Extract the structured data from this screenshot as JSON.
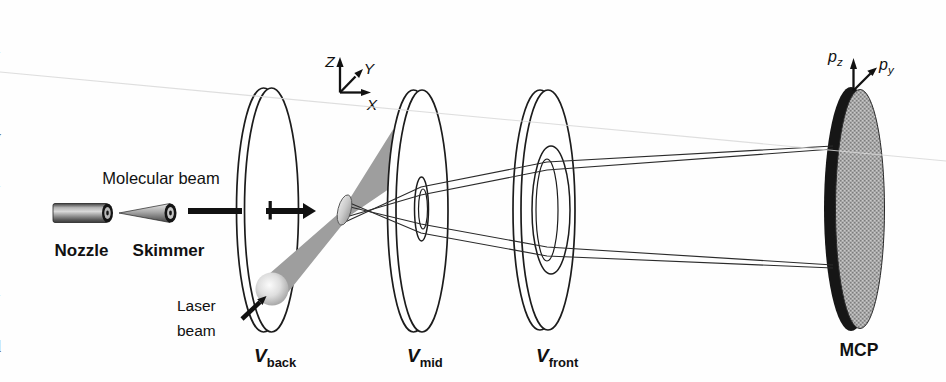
{
  "figure": {
    "labels": {
      "molecular_beam": "Molecular beam",
      "nozzle": "Nozzle",
      "skimmer": "Skimmer",
      "laser_line1": "Laser",
      "laser_line2": "beam",
      "v_back": {
        "main": "V",
        "sub": "back"
      },
      "v_mid": {
        "main": "V",
        "sub": "mid"
      },
      "v_front": {
        "main": "V",
        "sub": "front"
      },
      "mcp": "MCP",
      "axes": {
        "x": "X",
        "y": "Y",
        "z": "Z"
      },
      "momentum": {
        "pz_main": "p",
        "pz_sub": "z",
        "py_main": "p",
        "py_sub": "y"
      }
    },
    "colors": {
      "background": "#fefefe",
      "line": "#1c1c1c",
      "laser_beam_gray": "#9e9e9e",
      "mcp_gray": "#a9a9a9",
      "text": "#111111"
    },
    "edge_text_fragments": [
      {
        "ch": "s"
      },
      {
        "ch": "a"
      },
      {
        "ch": "l"
      },
      {
        "ch": "y"
      },
      {
        "ch": "a"
      },
      {
        "ch": "-"
      },
      {
        "ch": "l"
      },
      {
        "ch": "a"
      },
      {
        "ch": "t"
      },
      {
        "ch": "d"
      },
      {
        "ch": "f"
      }
    ]
  }
}
